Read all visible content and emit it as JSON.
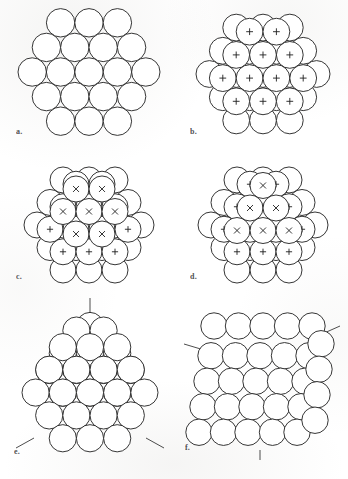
{
  "figure": {
    "kind": "close-packing-of-spheres-diagram",
    "background_color": "#ffffff",
    "ink_color": "#1f1f1f",
    "panel_count": 6
  },
  "panels": [
    {
      "id": "a",
      "label": "a.",
      "description": "single hexagonal close-packed layer of spheres",
      "marker": "",
      "marker_count": 0,
      "sphere_count": 19,
      "layers": 1
    },
    {
      "id": "b",
      "label": "b.",
      "description": "second layer of spheres seated in hollows of the first, marked with plus signs",
      "marker": "+",
      "marker_count": 12,
      "sphere_count": 31,
      "layers": 2
    },
    {
      "id": "c",
      "label": "c.",
      "description": "third layer added over the second, marked with crosses, giving cubic close packing",
      "marker": "x",
      "marker_count": 7,
      "sphere_count": 38,
      "layers": 3
    },
    {
      "id": "d",
      "label": "d.",
      "description": "alternative placement of the third layer, giving hexagonal close packing",
      "marker": "x",
      "marker_count": 6,
      "sphere_count": 38,
      "layers": 3
    },
    {
      "id": "e",
      "label": "e.",
      "description": "cluster of close-packed spheres viewed down a three-fold symmetry axis",
      "marker": "",
      "marker_count": 0,
      "sphere_count": 34,
      "layers": 4,
      "axis_lines": 3
    },
    {
      "id": "f",
      "label": "f.",
      "description": "the same cluster viewed down a four-fold axis showing square packing",
      "marker": "",
      "marker_count": 0,
      "sphere_count": 36,
      "layers": 4,
      "axis_lines": 3
    }
  ],
  "caption": {
    "text": "",
    "note": "caption text is cropped at the lower edge of the scan and is not legible"
  }
}
